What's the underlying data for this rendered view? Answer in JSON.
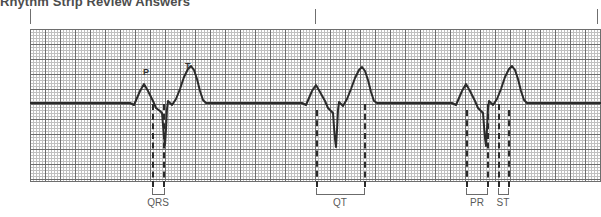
{
  "page": {
    "title": "Rhythm Strip Review Answers",
    "width": 601,
    "height": 217,
    "background": "#ffffff"
  },
  "colors": {
    "grid_fine": "#c0c0c0",
    "grid_bold": "#6e6e6e",
    "trace": "#2b2b2b",
    "dashed_marker": "#2b2b2b",
    "label_text": "#5a5a5a",
    "title_text": "#4d4d4d"
  },
  "grid": {
    "left": 30,
    "top": 29,
    "width": 571,
    "height": 153,
    "fine_spacing_px": 3,
    "bold_spacing_px": 15,
    "baseline_y": 74
  },
  "top_ticks": [
    {
      "name": "tick-start",
      "x": 30
    },
    {
      "name": "tick-middle",
      "x": 315
    },
    {
      "name": "tick-end",
      "x": 597
    }
  ],
  "wave_labels": [
    {
      "name": "p-wave-label",
      "text": "P",
      "x": 143,
      "y": 68
    },
    {
      "name": "t-wave-label",
      "text": "T",
      "x": 185,
      "y": 62
    }
  ],
  "measurement_lines": [
    {
      "name": "qrs-onset-line-1",
      "x": 152,
      "top": 104,
      "height": 83
    },
    {
      "name": "qrs-end-line-1",
      "x": 163,
      "top": 104,
      "height": 83
    },
    {
      "name": "qt-onset-line-2",
      "x": 316,
      "top": 110,
      "height": 77
    },
    {
      "name": "qt-end-line-2",
      "x": 364,
      "top": 104,
      "height": 83
    },
    {
      "name": "pr-onset-line-3",
      "x": 466,
      "top": 110,
      "height": 77
    },
    {
      "name": "pr-end-line-3",
      "x": 487,
      "top": 104,
      "height": 83
    },
    {
      "name": "st-onset-line-3",
      "x": 498,
      "top": 104,
      "height": 83
    },
    {
      "name": "st-end-line-3",
      "x": 508,
      "top": 110,
      "height": 77
    }
  ],
  "intervals": [
    {
      "name": "qrs-interval",
      "label": "QRS",
      "bracket_left": 152,
      "bracket_width": 12,
      "bracket_top": 188,
      "label_left": 128,
      "label_width": 60,
      "label_top": 198
    },
    {
      "name": "qt-interval",
      "label": "QT",
      "bracket_left": 316,
      "bracket_width": 49,
      "bracket_top": 188,
      "label_left": 310,
      "label_width": 60,
      "label_top": 198
    },
    {
      "name": "pr-interval",
      "label": "PR",
      "bracket_left": 466,
      "bracket_width": 22,
      "bracket_top": 188,
      "label_left": 447,
      "label_width": 60,
      "label_top": 198
    },
    {
      "name": "st-interval",
      "label": "ST",
      "bracket_left": 497,
      "bracket_width": 12,
      "bracket_top": 188,
      "label_left": 473,
      "label_width": 60,
      "label_top": 198
    }
  ],
  "ecg": {
    "type": "rhythm-strip",
    "beats": 3,
    "trace_color": "#2b2b2b",
    "trace_width_px": 2,
    "baseline_y": 74,
    "path": "M 0,74 L 100,74 L 104,76 L 110,62 L 114,55 L 118,62 L 123,72 L 126,79 L 130,82 L 132,84 L 133,96 L 134,108 L 135,116 L 136,100 L 137,80 L 138,72 L 140,74 L 142,76 L 146,70 L 150,60 L 154,48 L 158,40 L 161,37 L 164,41 L 167,50 L 170,62 L 173,71 L 176,74 L 182,74 L 272,74 L 276,76 L 282,62 L 286,56 L 290,63 L 295,72 L 298,79 L 301,82 L 303,84 L 304,98 L 305,110 L 306,118 L 307,101 L 308,81 L 309,73 L 311,75 L 313,77 L 317,70 L 321,60 L 325,49 L 329,41 L 332,38 L 335,42 L 338,51 L 341,63 L 344,72 L 347,74 L 353,74 L 422,74 L 426,76 L 432,62 L 436,55 L 440,62 L 445,72 L 448,79 L 451,82 L 453,84 L 454,97 L 455,109 L 456,117 L 457,100 L 458,80 L 459,72 L 461,74 L 463,76 L 467,70 L 471,60 L 475,48 L 479,40 L 482,37 L 485,41 L 488,50 L 491,62 L 494,71 L 497,74 L 503,74 L 571,74"
  }
}
